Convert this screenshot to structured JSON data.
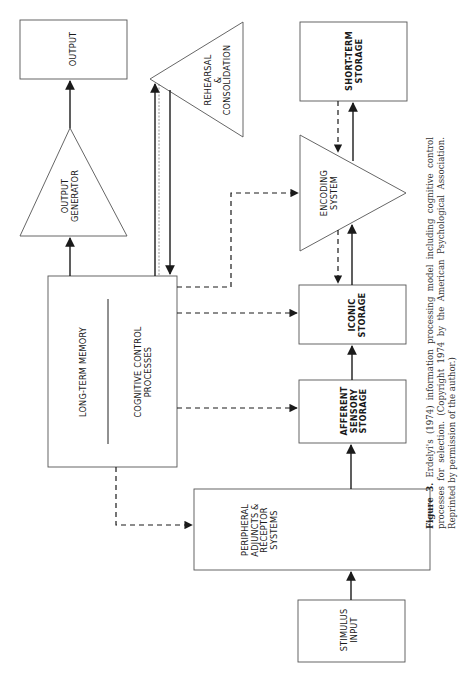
{
  "figure": {
    "nodes": {
      "output": "OUTPUT",
      "output_generator": "OUTPUT\nGENERATOR",
      "long_term_memory": "LONG-TERM MEMORY",
      "cognitive_control": "COGNITIVE CONTROL\nPROCESSES",
      "rehearsal": "REHEARSAL\n&\nCONSOLIDATION",
      "short_term_storage": "SHORT-TERM\nSTORAGE",
      "encoding_system": "ENCODING\nSYSTEM",
      "iconic_storage": "ICONIC\nSTORAGE",
      "afferent_storage": "AFFERENT\nSENSORY\nSTORAGE",
      "peripheral": "PERIPHERAL\nADJUNCTS &\nRECEPTOR\nSYSTEMS",
      "stimulus_input": "STIMULUS\nINPUT"
    },
    "edges": [
      {
        "from": "stimulus_input",
        "to": "peripheral",
        "style": "solid"
      },
      {
        "from": "peripheral",
        "to": "afferent_storage",
        "style": "solid"
      },
      {
        "from": "afferent_storage",
        "to": "iconic_storage",
        "style": "solid"
      },
      {
        "from": "iconic_storage",
        "to": "encoding_system",
        "style": "solid"
      },
      {
        "from": "encoding_system",
        "to": "iconic_storage",
        "style": "dashed"
      },
      {
        "from": "encoding_system",
        "to": "short_term_storage",
        "style": "solid"
      },
      {
        "from": "short_term_storage",
        "to": "encoding_system",
        "style": "dashed"
      },
      {
        "from": "long_term_memory",
        "to": "rehearsal",
        "style": "solid"
      },
      {
        "from": "rehearsal",
        "to": "long_term_memory",
        "style": "solid"
      },
      {
        "from": "long_term_memory",
        "to": "output_generator",
        "style": "solid"
      },
      {
        "from": "output_generator",
        "to": "output",
        "style": "solid"
      },
      {
        "from": "cognitive_control",
        "to": "encoding_system",
        "style": "dashed"
      },
      {
        "from": "cognitive_control",
        "to": "iconic_storage",
        "style": "dashed"
      },
      {
        "from": "cognitive_control",
        "to": "afferent_storage",
        "style": "dashed"
      },
      {
        "from": "cognitive_control",
        "to": "peripheral",
        "style": "dashed"
      }
    ]
  },
  "caption": {
    "label": "Figure 3.",
    "text": " Erdelyi's (1974) information processing model including cognitive control processes for selection. (Copyright 1974 by the American Psychological Association. Reprinted by permission of the author.)"
  },
  "colors": {
    "line": "#1a1a1a",
    "box_stroke": "#555555",
    "background": "#ffffff"
  }
}
